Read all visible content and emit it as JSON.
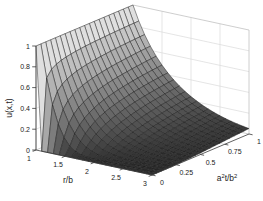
{
  "figure": {
    "width": 263,
    "height": 201,
    "background": "#ffffff",
    "axis_color": "#3a3a3a",
    "wall_edge_color": "#c2c2c2",
    "wall_grid_color": "#dadada",
    "mesh_line_color": "#161616",
    "surface_color_low": "#303030",
    "surface_color_high": "#dfdfdf",
    "tick_label_color": "#222222"
  },
  "chart_data": {
    "type": "surface",
    "title": "",
    "xlabel": "r/b",
    "ylabel": "a^2t/b^2",
    "zlabel": "u(x,t)",
    "colormap": "gray",
    "legend": "none",
    "x_axis": {
      "label": "r/b",
      "range": [
        1,
        3
      ],
      "ticks": [
        "1",
        "1.5",
        "2",
        "2.5",
        "3"
      ]
    },
    "y_axis": {
      "label": "a^2t/b^2",
      "range": [
        0,
        1
      ],
      "ticks": [
        "0",
        "0.25",
        "0.5",
        "0.75",
        "1"
      ]
    },
    "z_axis": {
      "label": "u(x,t)",
      "range": [
        0,
        1
      ],
      "ticks": [
        "0",
        "0.2",
        "0.4",
        "0.6",
        "0.8",
        "1"
      ]
    },
    "mesh": {
      "r_step": 0.1,
      "t_step": 0.05
    },
    "surface_model": "u = (b/r)*erfc((r/b - 1)/(2*sqrt(a^2 t/b^2))); u=1 at r/b=1; u=0 at t=0 for r/b>1",
    "samples": {
      "r_over_b": [
        1,
        1.25,
        1.5,
        1.75,
        2,
        2.25,
        2.5,
        2.75,
        3
      ],
      "a2t_over_b2": [
        0,
        0.25,
        0.5,
        0.75,
        1
      ],
      "u": [
        [
          1,
          0,
          0,
          0,
          0,
          0,
          0,
          0,
          0
        ],
        [
          1,
          0.58,
          0.32,
          0.17,
          0.08,
          0.034,
          0.014,
          0.005,
          0.002
        ],
        [
          1,
          0.64,
          0.41,
          0.26,
          0.16,
          0.094,
          0.053,
          0.029,
          0.015
        ],
        [
          1,
          0.67,
          0.46,
          0.31,
          0.21,
          0.137,
          0.088,
          0.056,
          0.034
        ],
        [
          1,
          0.69,
          0.48,
          0.34,
          0.24,
          0.167,
          0.116,
          0.079,
          0.052
        ]
      ]
    }
  }
}
